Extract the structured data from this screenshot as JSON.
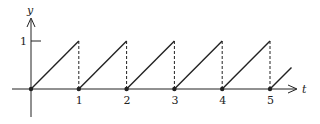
{
  "chart_data": {
    "type": "line",
    "title": "",
    "xlabel": "t",
    "ylabel": "y",
    "x_ticks": [
      "1",
      "2",
      "3",
      "4",
      "5"
    ],
    "y_ticks": [
      "1"
    ],
    "xlim": [
      0,
      5.6
    ],
    "ylim": [
      0,
      1
    ],
    "grid": false,
    "legend": null,
    "series": [
      {
        "name": "sawtooth",
        "segments": [
          {
            "x": [
              0,
              1
            ],
            "y": [
              0,
              1
            ]
          },
          {
            "x": [
              1,
              2
            ],
            "y": [
              0,
              1
            ]
          },
          {
            "x": [
              2,
              3
            ],
            "y": [
              0,
              1
            ]
          },
          {
            "x": [
              3,
              4
            ],
            "y": [
              0,
              1
            ]
          },
          {
            "x": [
              4,
              5
            ],
            "y": [
              0,
              1
            ]
          },
          {
            "x": [
              5,
              5.45
            ],
            "y": [
              0,
              0.45
            ]
          }
        ],
        "dots": [
          0,
          1,
          2,
          3,
          4,
          5
        ],
        "dashed_drops": [
          1,
          2,
          3,
          4,
          5
        ]
      }
    ]
  },
  "labels": {
    "x_axis": "t",
    "y_axis": "y",
    "x_ticks": [
      "1",
      "2",
      "3",
      "4",
      "5"
    ],
    "y_tick": "1"
  }
}
